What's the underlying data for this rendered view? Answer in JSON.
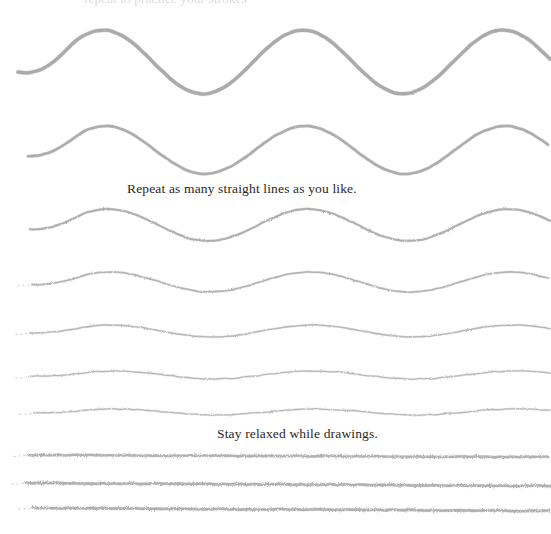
{
  "page": {
    "width": 551,
    "height": 534,
    "background_color": "#ffffff"
  },
  "captions": {
    "cropped_top": "repeat to practice your strokes",
    "repeat_line": "Repeat as many straight lines as you like.",
    "relaxed_line": "Stay relaxed while drawings.",
    "text_color": "#2a2724"
  },
  "stroke_style": {
    "color_dark": "#9a9a9a",
    "color_light": "#b6b6b6",
    "color_faint": "#c4c4c4",
    "pencil_texture": "rough"
  },
  "chart_data": {
    "type": "line",
    "xlabel": "",
    "ylabel": "",
    "xlim": [
      0,
      551
    ],
    "ylim": [
      0,
      534
    ],
    "grid": false,
    "legend": "none",
    "annotations": [
      {
        "text": "Repeat as many straight lines as you like.",
        "x": 127,
        "y": 190
      },
      {
        "text": "Stay relaxed while drawings.",
        "x": 217,
        "y": 435
      }
    ],
    "series": [
      {
        "name": "wave-1",
        "baseline_y": 62,
        "amplitude": 32,
        "wavelength": 200,
        "phase_x": 103,
        "start_x": 18,
        "end_x": 551,
        "stroke_width": 3.4,
        "color": "#a6a6a6"
      },
      {
        "name": "wave-2",
        "baseline_y": 150,
        "amplitude": 24,
        "wavelength": 200,
        "phase_x": 105,
        "start_x": 28,
        "end_x": 551,
        "stroke_width": 2.6,
        "color": "#a8a8a8"
      },
      {
        "name": "wave-3",
        "baseline_y": 225,
        "amplitude": 16,
        "wavelength": 200,
        "phase_x": 108,
        "start_x": 30,
        "end_x": 551,
        "stroke_width": 2.0,
        "color": "#ababab"
      },
      {
        "name": "wave-4",
        "baseline_y": 282,
        "amplitude": 10,
        "wavelength": 200,
        "phase_x": 110,
        "start_x": 32,
        "end_x": 551,
        "stroke_width": 1.6,
        "color": "#b0b0b0"
      },
      {
        "name": "wave-5",
        "baseline_y": 331,
        "amplitude": 6,
        "wavelength": 200,
        "phase_x": 112,
        "start_x": 30,
        "end_x": 551,
        "stroke_width": 1.4,
        "color": "#b4b4b4"
      },
      {
        "name": "wave-6",
        "baseline_y": 375,
        "amplitude": 4,
        "wavelength": 200,
        "phase_x": 114,
        "start_x": 30,
        "end_x": 551,
        "stroke_width": 1.3,
        "color": "#b6b6b6"
      },
      {
        "name": "wave-7",
        "baseline_y": 412,
        "amplitude": 3,
        "wavelength": 200,
        "phase_x": 116,
        "start_x": 34,
        "end_x": 551,
        "stroke_width": 1.3,
        "color": "#b8b8b8"
      },
      {
        "name": "line-8",
        "baseline_y": 455,
        "amplitude": 0,
        "wavelength": 200,
        "phase_x": 0,
        "start_x": 28,
        "end_x": 551,
        "stroke_width": 2.2,
        "color": "#b0b0b0",
        "tilt": 2
      },
      {
        "name": "line-9",
        "baseline_y": 483,
        "amplitude": 0,
        "wavelength": 200,
        "phase_x": 0,
        "start_x": 26,
        "end_x": 551,
        "stroke_width": 2.4,
        "color": "#aeaeae",
        "tilt": 3
      },
      {
        "name": "line-10",
        "baseline_y": 508,
        "amplitude": 0,
        "wavelength": 200,
        "phase_x": 0,
        "start_x": 33,
        "end_x": 551,
        "stroke_width": 2.4,
        "color": "#aeaeae",
        "tilt": 3
      }
    ]
  }
}
